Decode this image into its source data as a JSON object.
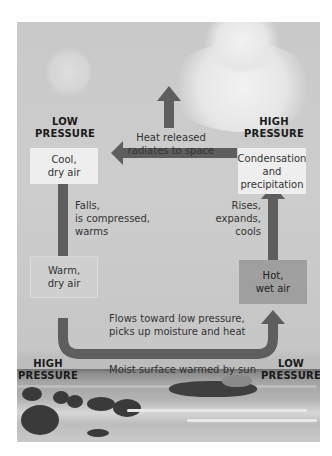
{
  "diagram": {
    "pressure_labels": {
      "top_left": "LOW\nPRESSURE",
      "top_right": "HIGH\nPRESSURE",
      "bottom_left": "HIGH\nPRESSURE",
      "bottom_right": "LOW\nPRESSURE"
    },
    "boxes": {
      "cool_dry": "Cool,\ndry air",
      "condensation": "Condensation\nand\nprecipitation",
      "warm_dry": "Warm,\ndry air",
      "hot_wet": "Hot,\nwet air"
    },
    "captions": {
      "heat_released": "Heat released\nradiates to space",
      "falls": "Falls,\nis compressed,\nwarms",
      "rises": "Rises,\nexpands,\ncools",
      "flows": "Flows toward low pressure,\npicks up moisture and heat",
      "surface": "Moist surface warmed by sun"
    },
    "colors": {
      "arrow": "#5e5e5e",
      "panel": "#cacaca",
      "light_box": "#eeeeee",
      "dark_box": "#9f9f9f"
    }
  }
}
